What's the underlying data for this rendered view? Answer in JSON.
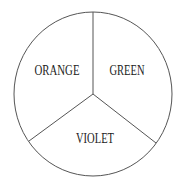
{
  "diagram": {
    "type": "pie-division",
    "sectors": [
      {
        "label": "ORANGE",
        "position": "upper-left"
      },
      {
        "label": "GREEN",
        "position": "upper-right"
      },
      {
        "label": "VIOLET",
        "position": "bottom"
      }
    ],
    "colors": {
      "stroke": "#555555",
      "text": "#222222",
      "background": "#ffffff"
    }
  }
}
